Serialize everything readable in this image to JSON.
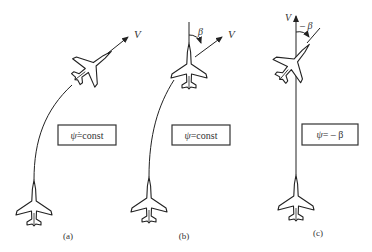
{
  "panels": [
    {
      "id": "a",
      "caption": "(a)",
      "velocity_label": "V",
      "equation": {
        "symbol": "ψ̇",
        "rest": "=const"
      }
    },
    {
      "id": "b",
      "caption": "(b)",
      "velocity_label": "V",
      "angle_label": "β",
      "equation": {
        "symbol": "ψ",
        "rest": "=const"
      }
    },
    {
      "id": "c",
      "caption": "(c)",
      "velocity_label": "V",
      "angle_label": "– β",
      "equation": {
        "symbol": "ψ",
        "rest": "= –  β"
      }
    }
  ],
  "colors": {
    "line": "#222222",
    "background": "#ffffff"
  }
}
